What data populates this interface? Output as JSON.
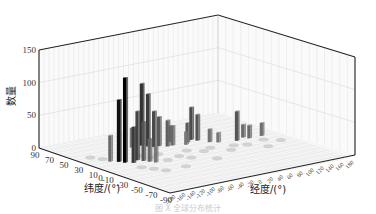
{
  "chart_data": {
    "type": "bar3d",
    "title": "",
    "zlabel": "数量",
    "ylabel": "纬度/(°)",
    "xlabel": "经度/(°)",
    "zlim": [
      0,
      150
    ],
    "z_ticks": [
      "0",
      "50",
      "100",
      "150"
    ],
    "lat_ticks": [
      "90",
      "70",
      "50",
      "30",
      "10",
      "0",
      "-10",
      "-30",
      "-50",
      "-70",
      "-90"
    ],
    "lon_ticks": [
      "-180",
      "-160",
      "-140",
      "-120",
      "-100",
      "-80",
      "-60",
      "-40",
      "-20",
      "0",
      "20",
      "40",
      "60",
      "80",
      "100",
      "120",
      "140",
      "160",
      "180"
    ],
    "grid": true,
    "bars": [
      {
        "lon": -140,
        "lat": 20,
        "value": 40,
        "shade": "#6a6a6a"
      },
      {
        "lon": -130,
        "lat": 15,
        "value": 95,
        "shade": "#111111"
      },
      {
        "lon": -125,
        "lat": 10,
        "value": 130,
        "shade": "#000000"
      },
      {
        "lon": -115,
        "lat": 5,
        "value": 55,
        "shade": "#3a3a3a"
      },
      {
        "lon": -100,
        "lat": 10,
        "value": 75,
        "shade": "#444444"
      },
      {
        "lon": -95,
        "lat": 5,
        "value": 60,
        "shade": "#555555"
      },
      {
        "lon": -90,
        "lat": 0,
        "value": 35,
        "shade": "#666666"
      },
      {
        "lon": -85,
        "lat": -5,
        "value": 25,
        "shade": "#777777"
      },
      {
        "lon": -60,
        "lat": 45,
        "value": 30,
        "shade": "#7a7a7a"
      },
      {
        "lon": -40,
        "lat": 45,
        "value": 95,
        "shade": "#333333"
      },
      {
        "lon": -35,
        "lat": 40,
        "value": 80,
        "shade": "#3c3c3c"
      },
      {
        "lon": -30,
        "lat": 35,
        "value": 55,
        "shade": "#4a4a4a"
      },
      {
        "lon": -20,
        "lat": 35,
        "value": 45,
        "shade": "#5a5a5a"
      },
      {
        "lon": -10,
        "lat": 30,
        "value": 40,
        "shade": "#606060"
      },
      {
        "lon": 0,
        "lat": 30,
        "value": 30,
        "shade": "#6a6a6a"
      },
      {
        "lon": 10,
        "lat": 40,
        "value": 25,
        "shade": "#707070"
      },
      {
        "lon": 20,
        "lat": 25,
        "value": 20,
        "shade": "#777777"
      },
      {
        "lon": 30,
        "lat": 30,
        "value": 30,
        "shade": "#5a5a5a"
      },
      {
        "lon": 45,
        "lat": 35,
        "value": 50,
        "shade": "#4a4a4a"
      },
      {
        "lon": 50,
        "lat": 30,
        "value": 40,
        "shade": "#555555"
      },
      {
        "lon": 60,
        "lat": 20,
        "value": 20,
        "shade": "#707070"
      },
      {
        "lon": 70,
        "lat": 15,
        "value": 15,
        "shade": "#777777"
      },
      {
        "lon": 100,
        "lat": 10,
        "value": 45,
        "shade": "#555555"
      },
      {
        "lon": 120,
        "lat": 15,
        "value": 20,
        "shade": "#6a6a6a"
      },
      {
        "lon": 125,
        "lat": 10,
        "value": 20,
        "shade": "#6a6a6a"
      },
      {
        "lon": 150,
        "lat": 10,
        "value": 20,
        "shade": "#707070"
      }
    ]
  },
  "caption": "图 X  全球分布统计"
}
